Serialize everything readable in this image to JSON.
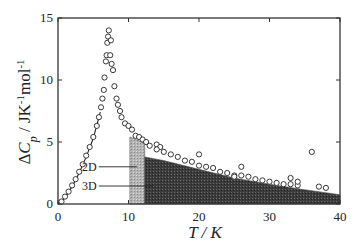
{
  "chart_data": {
    "type": "scatter",
    "title": "",
    "xlabel": "T / K",
    "ylabel": "ΔCp / JK⁻¹mol⁻¹",
    "xlim": [
      0,
      40
    ],
    "ylim": [
      0,
      15
    ],
    "xticks": [
      0,
      10,
      20,
      30,
      40
    ],
    "yticks": [
      0,
      5,
      10,
      15
    ],
    "grid": false,
    "legend": null,
    "annotations": [
      {
        "text": "2D",
        "target": "light shaded region (2D contribution)",
        "x": 5.5,
        "y": 3.0
      },
      {
        "text": "3D",
        "target": "dark shaded region (3D contribution)",
        "x": 5.5,
        "y": 1.45
      }
    ],
    "series": [
      {
        "name": "Experimental ΔCp",
        "marker": "open-circle",
        "points": [
          [
            0.5,
            0.2
          ],
          [
            1.0,
            0.6
          ],
          [
            1.5,
            1.0
          ],
          [
            2.0,
            1.5
          ],
          [
            2.5,
            2.0
          ],
          [
            3.0,
            2.6
          ],
          [
            3.5,
            3.2
          ],
          [
            4.0,
            3.9
          ],
          [
            4.5,
            4.6
          ],
          [
            5.0,
            5.4
          ],
          [
            5.5,
            6.3
          ],
          [
            5.8,
            7.0
          ],
          [
            6.1,
            7.8
          ],
          [
            6.3,
            8.5
          ],
          [
            6.5,
            9.2
          ],
          [
            6.6,
            10.2
          ],
          [
            6.8,
            11.5
          ],
          [
            6.9,
            12.0
          ],
          [
            7.0,
            13.0
          ],
          [
            7.1,
            13.5
          ],
          [
            7.2,
            14.0
          ],
          [
            7.5,
            13.2
          ],
          [
            7.4,
            12.0
          ],
          [
            7.6,
            11.3
          ],
          [
            7.8,
            10.8
          ],
          [
            8.0,
            9.5
          ],
          [
            8.3,
            8.5
          ],
          [
            8.5,
            8.0
          ],
          [
            8.8,
            7.5
          ],
          [
            9.0,
            7.0
          ],
          [
            9.5,
            6.5
          ],
          [
            10.0,
            6.3
          ],
          [
            10.5,
            6.0
          ],
          [
            11.0,
            5.5
          ],
          [
            11.5,
            5.4
          ],
          [
            12.0,
            5.2
          ],
          [
            12.5,
            5.0
          ],
          [
            13.0,
            4.7
          ],
          [
            14.0,
            4.8
          ],
          [
            14.5,
            4.6
          ],
          [
            14.0,
            4.4
          ],
          [
            15.0,
            4.2
          ],
          [
            16.0,
            4.0
          ],
          [
            17.0,
            3.8
          ],
          [
            18.0,
            3.5
          ],
          [
            19.0,
            3.4
          ],
          [
            20.0,
            3.1
          ],
          [
            20.0,
            4.0
          ],
          [
            21.0,
            3.0
          ],
          [
            22.0,
            2.9
          ],
          [
            23.0,
            2.6
          ],
          [
            24.0,
            2.5
          ],
          [
            25.0,
            2.3
          ],
          [
            25.0,
            2.2
          ],
          [
            26.0,
            2.3
          ],
          [
            26.0,
            3.0
          ],
          [
            27.0,
            2.2
          ],
          [
            28.0,
            2.0
          ],
          [
            29.0,
            1.9
          ],
          [
            30.0,
            1.8
          ],
          [
            31.0,
            1.7
          ],
          [
            32.0,
            1.6
          ],
          [
            33.0,
            1.6
          ],
          [
            33.0,
            2.1
          ],
          [
            34.0,
            1.5
          ],
          [
            34.0,
            1.8
          ],
          [
            36.0,
            4.2
          ],
          [
            37.0,
            1.4
          ],
          [
            38.0,
            1.3
          ]
        ]
      },
      {
        "name": "Fit (low-T)",
        "type": "line",
        "points": [
          [
            0,
            0
          ],
          [
            1,
            0.5
          ],
          [
            2,
            1.4
          ],
          [
            3,
            2.5
          ],
          [
            4,
            3.8
          ],
          [
            5,
            5.3
          ],
          [
            6,
            7.4
          ]
        ]
      },
      {
        "name": "2D contribution",
        "type": "area",
        "fill": "#b8b8b8",
        "points": [
          [
            10.2,
            0
          ],
          [
            10.2,
            5.4
          ],
          [
            12.3,
            4.9
          ],
          [
            12.3,
            0
          ]
        ]
      },
      {
        "name": "3D contribution",
        "type": "area",
        "fill": "#3a3a3a",
        "points": [
          [
            12.3,
            0
          ],
          [
            12.3,
            3.8
          ],
          [
            15,
            3.5
          ],
          [
            20,
            2.8
          ],
          [
            25,
            2.1
          ],
          [
            30,
            1.6
          ],
          [
            35,
            1.15
          ],
          [
            40,
            0.75
          ],
          [
            40,
            0
          ]
        ]
      }
    ]
  }
}
